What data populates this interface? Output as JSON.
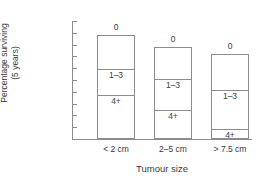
{
  "chart_data": {
    "type": "bar",
    "subtype": "stacked-segmented-outline",
    "title": "",
    "xlabel": "Tumour size",
    "ylabel_line1": "Percentage surviving",
    "ylabel_line2": "(5 years)",
    "ylim": [
      0,
      100
    ],
    "yticks": [
      100,
      90,
      80,
      70,
      60,
      50,
      40,
      30,
      20,
      10,
      0
    ],
    "grid": false,
    "legend": "none",
    "categories": [
      "< 2 cm",
      "2–5 cm",
      "> 7.5 cm"
    ],
    "segment_names": [
      "0",
      "1–3",
      "4+"
    ],
    "series": [
      {
        "name": "0",
        "values": [
          88.5,
          78,
          72
        ]
      },
      {
        "name": "1–3",
        "values": [
          60,
          51.5,
          42
        ]
      },
      {
        "name": "4+",
        "values": [
          38,
          25,
          9
        ]
      }
    ],
    "bars": [
      {
        "category": "< 2 cm",
        "top": 88.5,
        "boundaries": [
          88.5,
          60,
          38,
          0
        ],
        "segments": [
          {
            "label": "0",
            "from": 60,
            "to": 88.5,
            "label_position": "above-bar"
          },
          {
            "label": "1–3",
            "from": 38,
            "to": 60,
            "label_position": "top-of-segment"
          },
          {
            "label": "4+",
            "from": 0,
            "to": 38,
            "label_position": "top-of-segment"
          }
        ]
      },
      {
        "category": "2–5 cm",
        "top": 78,
        "boundaries": [
          78,
          51.5,
          25,
          0
        ],
        "segments": [
          {
            "label": "0",
            "from": 51.5,
            "to": 78,
            "label_position": "above-bar"
          },
          {
            "label": "1–3",
            "from": 25,
            "to": 51.5,
            "label_position": "top-of-segment"
          },
          {
            "label": "4+",
            "from": 0,
            "to": 25,
            "label_position": "top-of-segment"
          }
        ]
      },
      {
        "category": "> 7.5 cm",
        "top": 72,
        "boundaries": [
          72,
          42,
          9,
          0
        ],
        "segments": [
          {
            "label": "0",
            "from": 42,
            "to": 72,
            "label_position": "above-bar"
          },
          {
            "label": "1–3",
            "from": 9,
            "to": 42,
            "label_position": "top-of-segment"
          },
          {
            "label": "4+",
            "from": 0,
            "to": 9,
            "label_position": "top-of-segment"
          }
        ]
      }
    ],
    "colors": {
      "bar_fill": "#ffffff",
      "bar_stroke": "#8c8c8c",
      "axis": "#8c8c8c",
      "text": "#3a3a3a",
      "background": "#ffffff"
    }
  }
}
